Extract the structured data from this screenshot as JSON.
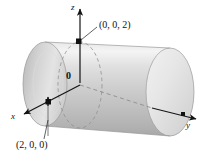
{
  "figure": {
    "type": "3d-geometry-diagram",
    "width": 209,
    "height": 165,
    "background_color": "#ffffff"
  },
  "axes": [
    {
      "id": "z",
      "label": "z",
      "direction": "up",
      "label_style": "italic"
    },
    {
      "id": "x",
      "label": "x",
      "direction": "down-left",
      "label_style": "italic"
    },
    {
      "id": "y",
      "label": "y",
      "direction": "right",
      "label_style": "italic"
    }
  ],
  "origin": {
    "label": "0"
  },
  "points": [
    {
      "id": "top",
      "label": "(0, 0, 2)",
      "marker": "filled-square",
      "leader": true
    },
    {
      "id": "bottom",
      "label": "(2, 0, 0)",
      "marker": "filled-square",
      "leader": true
    }
  ],
  "solid": {
    "name": "cylinder",
    "radius_label": "2",
    "surface_light": "#f2f2f2",
    "surface_mid": "#cfcfcf",
    "surface_dark": "#9a9a9a",
    "cap_light": "#efefef",
    "cap_dark": "#b8b8b8",
    "outline_color": "#8a8a8a"
  },
  "strokes": {
    "axis_color": "#1a1a1a",
    "dashed_color": "#8f8f8f",
    "leader_color": "#3a3a3a"
  }
}
